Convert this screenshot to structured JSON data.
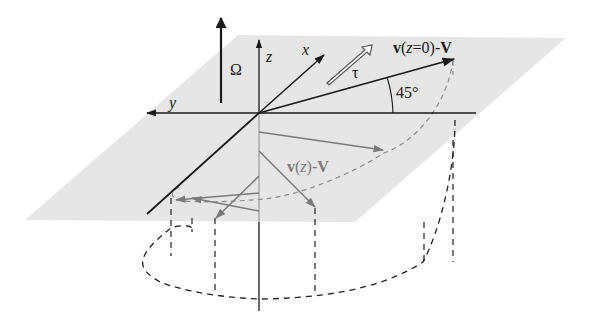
{
  "figure": {
    "labels": {
      "omega": "Ω",
      "z_axis": "z",
      "x_axis": "x",
      "y_axis": "y",
      "tau": "τ",
      "surface_velocity_v": "v",
      "surface_velocity_paren_open": "(",
      "surface_velocity_z": "z",
      "surface_velocity_eq": "=0)-",
      "surface_velocity_V": "V",
      "angle": "45°",
      "depth_velocity_v": "v",
      "depth_velocity_paren_open": "(",
      "depth_velocity_z": "z",
      "depth_velocity_close": ")-",
      "depth_velocity_V": "V"
    },
    "colors": {
      "plane_fill": "#e6e6e6",
      "axis": "#1a1a1a",
      "subsurface_arrow": "#7a7a7a",
      "dashed_on_plane": "#8c8c8c",
      "dashed_below": "#222222",
      "background": "#ffffff"
    }
  }
}
